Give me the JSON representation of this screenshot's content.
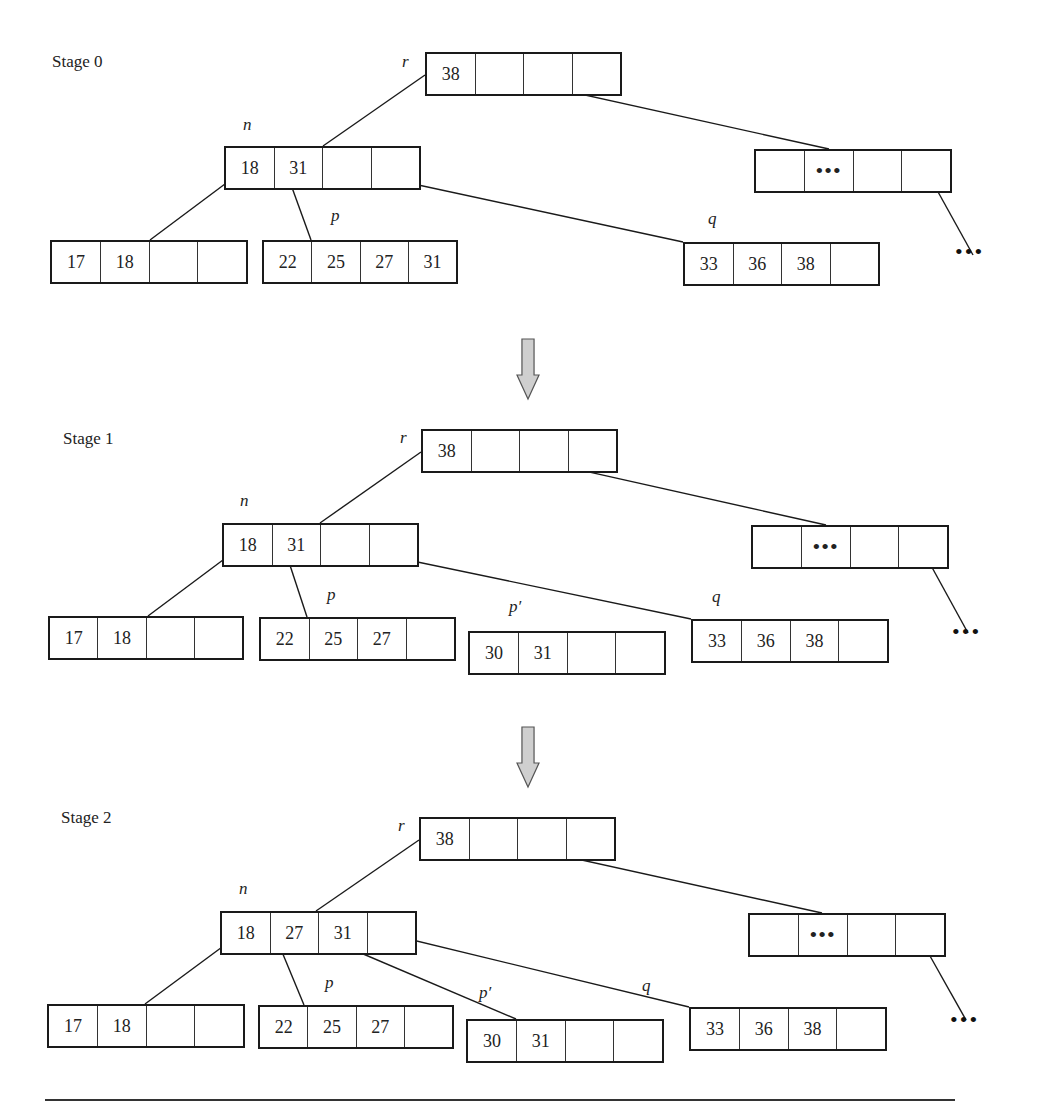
{
  "figure": {
    "stages": [
      {
        "label": "Stage 0",
        "label_pos": [
          52,
          64
        ],
        "nodes": [
          {
            "id": "r",
            "label": "r",
            "x": 425,
            "y": 52,
            "w": 197,
            "cells": [
              "38",
              "",
              "",
              ""
            ],
            "label_pos": [
              402,
              64
            ]
          },
          {
            "id": "n",
            "label": "n",
            "x": 224,
            "y": 146,
            "w": 197,
            "cells": [
              "18",
              "31",
              "",
              ""
            ],
            "label_pos": [
              243,
              127
            ]
          },
          {
            "id": "right",
            "label": "",
            "x": 754,
            "y": 149,
            "w": 198,
            "cells": [
              "",
              "•••",
              "",
              ""
            ],
            "ellipsis": true
          },
          {
            "id": "leaf1",
            "label": "",
            "x": 50,
            "y": 240,
            "w": 198,
            "cells": [
              "17",
              "18",
              "",
              ""
            ]
          },
          {
            "id": "p",
            "label": "p",
            "x": 262,
            "y": 240,
            "w": 196,
            "cells": [
              "22",
              "25",
              "27",
              "31"
            ],
            "label_pos": [
              331,
              218
            ]
          },
          {
            "id": "q",
            "label": "q",
            "x": 683,
            "y": 242,
            "w": 197,
            "cells": [
              "33",
              "36",
              "38",
              ""
            ],
            "label_pos": [
              708,
              221
            ]
          }
        ],
        "edges": [
          [
            425,
            75,
            323,
            146
          ],
          [
            241,
            172,
            150,
            240
          ],
          [
            286,
            171,
            311,
            240
          ],
          [
            358,
            172,
            683,
            242
          ],
          [
            508,
            78,
            829,
            149
          ],
          [
            927,
            172,
            973,
            255
          ]
        ],
        "trailing_dots": {
          "text": "•••",
          "pos": [
            955,
            255
          ]
        }
      },
      {
        "label": "Stage 1",
        "label_pos": [
          63,
          441
        ],
        "nodes": [
          {
            "id": "r",
            "label": "r",
            "x": 421,
            "y": 429,
            "w": 197,
            "cells": [
              "38",
              "",
              "",
              ""
            ],
            "label_pos": [
              400,
              440
            ]
          },
          {
            "id": "n",
            "label": "n",
            "x": 222,
            "y": 523,
            "w": 197,
            "cells": [
              "18",
              "31",
              "",
              ""
            ],
            "label_pos": [
              240,
              503
            ]
          },
          {
            "id": "right",
            "label": "",
            "x": 751,
            "y": 525,
            "w": 198,
            "cells": [
              "",
              "•••",
              "",
              ""
            ],
            "ellipsis": true
          },
          {
            "id": "leaf1",
            "label": "",
            "x": 48,
            "y": 616,
            "w": 196,
            "cells": [
              "17",
              "18",
              "",
              ""
            ]
          },
          {
            "id": "p",
            "label": "p",
            "x": 259,
            "y": 617,
            "w": 197,
            "cells": [
              "22",
              "25",
              "27",
              ""
            ],
            "label_pos": [
              327,
              597
            ]
          },
          {
            "id": "p_prime",
            "label": "p′",
            "x": 468,
            "y": 631,
            "w": 198,
            "cells": [
              "30",
              "31",
              "",
              ""
            ],
            "label_pos": [
              509,
              609
            ]
          },
          {
            "id": "q",
            "label": "q",
            "x": 691,
            "y": 619,
            "w": 198,
            "cells": [
              "33",
              "36",
              "38",
              ""
            ],
            "label_pos": [
              712,
              599
            ]
          }
        ],
        "edges": [
          [
            421,
            452,
            320,
            523
          ],
          [
            239,
            548,
            148,
            616
          ],
          [
            284,
            547,
            307,
            617
          ],
          [
            355,
            549,
            691,
            619
          ],
          [
            504,
            453,
            826,
            525
          ],
          [
            923,
            551,
            968,
            633
          ]
        ],
        "trailing_dots": {
          "text": "•••",
          "pos": [
            952,
            635
          ]
        }
      },
      {
        "label": "Stage 2",
        "label_pos": [
          61,
          820
        ],
        "nodes": [
          {
            "id": "r",
            "label": "r",
            "x": 419,
            "y": 817,
            "w": 197,
            "cells": [
              "38",
              "",
              "",
              ""
            ],
            "label_pos": [
              398,
              828
            ]
          },
          {
            "id": "n",
            "label": "n",
            "x": 220,
            "y": 911,
            "w": 197,
            "cells": [
              "18",
              "27",
              "31",
              ""
            ],
            "label_pos": [
              239,
              891
            ]
          },
          {
            "id": "right",
            "label": "",
            "x": 748,
            "y": 913,
            "w": 198,
            "cells": [
              "",
              "•••",
              "",
              ""
            ],
            "ellipsis": true
          },
          {
            "id": "leaf1",
            "label": "",
            "x": 47,
            "y": 1004,
            "w": 198,
            "cells": [
              "17",
              "18",
              "",
              ""
            ]
          },
          {
            "id": "p",
            "label": "p",
            "x": 258,
            "y": 1005,
            "w": 196,
            "cells": [
              "22",
              "25",
              "27",
              ""
            ],
            "label_pos": [
              325,
              985
            ]
          },
          {
            "id": "p_prime",
            "label": "p′",
            "x": 466,
            "y": 1019,
            "w": 198,
            "cells": [
              "30",
              "31",
              "",
              ""
            ],
            "label_pos": [
              479,
              995
            ]
          },
          {
            "id": "q",
            "label": "q",
            "x": 689,
            "y": 1007,
            "w": 198,
            "cells": [
              "33",
              "36",
              "38",
              ""
            ],
            "label_pos": [
              642,
              988
            ]
          }
        ],
        "edges": [
          [
            419,
            840,
            316,
            911
          ],
          [
            237,
            936,
            145,
            1004
          ],
          [
            275,
            935,
            304,
            1005
          ],
          [
            328,
            939,
            516,
            1019
          ],
          [
            392,
            935,
            689,
            1007
          ],
          [
            500,
            842,
            822,
            913
          ],
          [
            921,
            940,
            966,
            1020
          ]
        ],
        "trailing_dots": {
          "text": "•••",
          "pos": [
            950,
            1023
          ]
        }
      }
    ],
    "arrows": [
      {
        "x": 517,
        "y": 339,
        "w": 22,
        "h": 60
      },
      {
        "x": 517,
        "y": 727,
        "w": 22,
        "h": 60
      }
    ],
    "bottom_rule": {
      "x": 45,
      "y": 1099,
      "w": 910
    },
    "colors": {
      "stroke": "#1a1a1a",
      "arrow_fill": "#cfcfcf",
      "arrow_stroke": "#555555"
    }
  }
}
